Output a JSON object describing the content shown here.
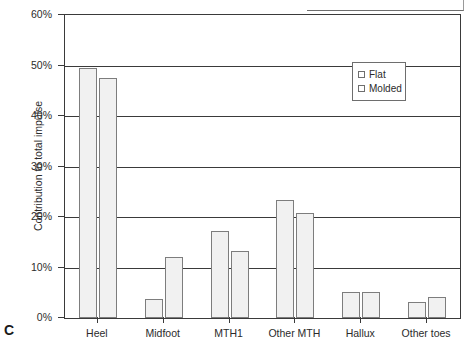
{
  "panel": {
    "letter": "C"
  },
  "chart_data": {
    "type": "bar",
    "title": "",
    "xlabel": "",
    "ylabel": "Contribution to total impulse",
    "ylim": [
      0,
      60
    ],
    "ytick_labels": [
      "0%",
      "10%",
      "20%",
      "30%",
      "40%",
      "50%",
      "60%"
    ],
    "ytick_values": [
      0,
      10,
      20,
      30,
      40,
      50,
      60
    ],
    "grid": "horizontal",
    "legend_position": "upper-right-inside",
    "categories": [
      "Heel",
      "Midfoot",
      "MTH1",
      "Other MTH",
      "Hallux",
      "Other toes"
    ],
    "series": [
      {
        "name": "Flat",
        "values": [
          49.5,
          3.8,
          17.3,
          23.4,
          5.1,
          3.1
        ]
      },
      {
        "name": "Molded",
        "values": [
          47.6,
          12.0,
          13.2,
          20.8,
          5.2,
          4.2
        ]
      }
    ],
    "bar_fill": "#f1f1f1",
    "bar_border": "#7d7d7d",
    "axis_color": "#3a3a3a"
  }
}
